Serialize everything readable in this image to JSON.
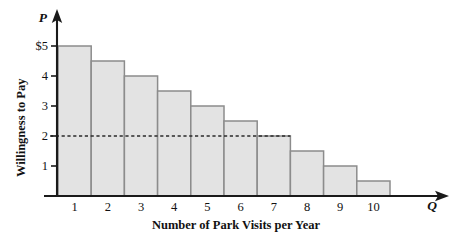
{
  "chart_data": {
    "type": "bar",
    "title": "",
    "xlabel": "Number of Park Visits per Year",
    "ylabel": "Willingness to Pay",
    "x_axis_symbol": "Q",
    "y_axis_symbol": "P",
    "categories": [
      "1",
      "2",
      "3",
      "4",
      "5",
      "6",
      "7",
      "8",
      "9",
      "10"
    ],
    "values": [
      5,
      4.5,
      4,
      3.5,
      3,
      2.5,
      2,
      1.5,
      1,
      0.5
    ],
    "ytick_labels": [
      "$5",
      "4",
      "3",
      "2",
      "1"
    ],
    "ytick_values": [
      5,
      4,
      3,
      2,
      1
    ],
    "ylim": [
      0,
      5.6
    ],
    "xlim": [
      0,
      10
    ],
    "grid": false,
    "legend": null,
    "annotations": [
      {
        "name": "price-reference-line",
        "type": "horizontal-dashed",
        "value": 2,
        "extends_to_category": "7"
      }
    ],
    "colors": {
      "bar_fill": "#e3e3e3",
      "bar_stroke": "#8c8c8c",
      "axis": "#1a1a1a",
      "dash": "#2b2b2b",
      "background": "#ffffff"
    }
  }
}
